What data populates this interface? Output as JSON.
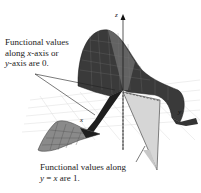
{
  "figure": {
    "annotation_top": {
      "line1": "Functional values",
      "line2_pre": "along ",
      "line2_var": "x",
      "line2_post": "-axis or",
      "line3_var": "y",
      "line3_post": "-axis are 0."
    },
    "annotation_bottom": {
      "line1": "Functional values along",
      "line2_var1": "y",
      "line2_eq": " = ",
      "line2_var2": "x",
      "line2_post": " are 1."
    },
    "axes": {
      "z": "z",
      "x": "x",
      "y": "y"
    },
    "colors": {
      "surface_dark": "#2b2b2b",
      "surface_mid": "#5a5a5a",
      "surface_light": "#9a9a9a",
      "plane_grid": "#d8d8d8",
      "wedge_fill": "#d4d4d4",
      "text": "#222222"
    }
  }
}
